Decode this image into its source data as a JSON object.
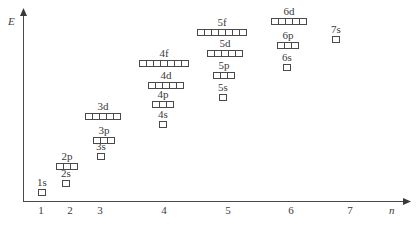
{
  "diagram": {
    "y_axis_label": "E",
    "x_axis_label": "n",
    "x_ticks": [
      {
        "label": "1",
        "x": 41
      },
      {
        "label": "2",
        "x": 70
      },
      {
        "label": "3",
        "x": 100
      },
      {
        "label": "4",
        "x": 164
      },
      {
        "label": "5",
        "x": 228
      },
      {
        "label": "6",
        "x": 291
      },
      {
        "label": "7",
        "x": 350
      }
    ],
    "orbitals": [
      {
        "label": "1s",
        "boxes": 1,
        "cx": 42,
        "y": 189
      },
      {
        "label": "2s",
        "boxes": 1,
        "cx": 66,
        "y": 180
      },
      {
        "label": "2p",
        "boxes": 3,
        "cx": 67,
        "y": 163
      },
      {
        "label": "3s",
        "boxes": 1,
        "cx": 101,
        "y": 153
      },
      {
        "label": "3p",
        "boxes": 3,
        "cx": 104,
        "y": 137
      },
      {
        "label": "3d",
        "boxes": 5,
        "cx": 103,
        "y": 113
      },
      {
        "label": "4s",
        "boxes": 1,
        "cx": 163,
        "y": 121
      },
      {
        "label": "4p",
        "boxes": 3,
        "cx": 163,
        "y": 101
      },
      {
        "label": "4d",
        "boxes": 5,
        "cx": 166,
        "y": 82
      },
      {
        "label": "4f",
        "boxes": 7,
        "cx": 164,
        "y": 60
      },
      {
        "label": "5s",
        "boxes": 1,
        "cx": 223,
        "y": 94
      },
      {
        "label": "5p",
        "boxes": 3,
        "cx": 224,
        "y": 72
      },
      {
        "label": "5d",
        "boxes": 5,
        "cx": 225,
        "y": 50
      },
      {
        "label": "5f",
        "boxes": 7,
        "cx": 222,
        "y": 29
      },
      {
        "label": "6s",
        "boxes": 1,
        "cx": 287,
        "y": 64
      },
      {
        "label": "6p",
        "boxes": 3,
        "cx": 288,
        "y": 42
      },
      {
        "label": "6d",
        "boxes": 5,
        "cx": 289,
        "y": 18
      },
      {
        "label": "7s",
        "boxes": 1,
        "cx": 336,
        "y": 36
      }
    ]
  }
}
